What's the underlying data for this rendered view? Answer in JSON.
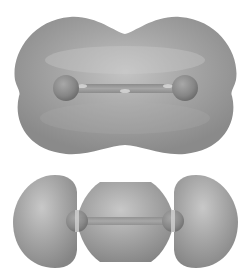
{
  "figure": {
    "panels": [
      {
        "id": "top",
        "description": "Bonding-type isosurface enclosing both atoms (peanut-shaped)",
        "atoms": [
          {
            "cx": 66,
            "cy": 88,
            "r": 13
          },
          {
            "cx": 185,
            "cy": 88,
            "r": 13
          }
        ]
      },
      {
        "id": "bottom",
        "description": "Three-lobed isosurface: two outer lobes and a central lobe between atoms",
        "atoms": [
          {
            "cx": 77,
            "cy": 221,
            "r": 11
          },
          {
            "cx": 173,
            "cy": 221,
            "r": 11
          }
        ]
      }
    ],
    "colors": {
      "surface": "#9a9a9a",
      "surface_highlight": "#c8c8c8",
      "surface_shadow": "#7c7c7c",
      "atom": "#8a8a8a",
      "bond": "#9c9c9c",
      "background": "#ffffff"
    }
  }
}
